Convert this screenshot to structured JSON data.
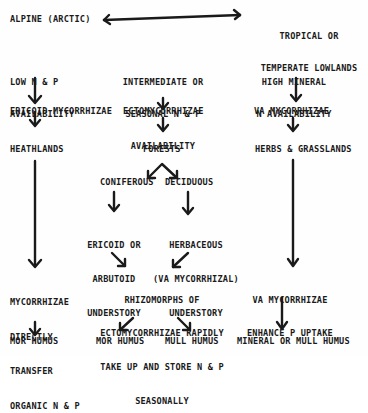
{
  "diagram": {
    "colors": {
      "ink": "#1a1a1a",
      "background": "#fefefe"
    },
    "top": {
      "left_label": "ALPINE (ARCTIC)",
      "right_label_line1": "TROPICAL OR",
      "right_label_line2": "TEMPERATE LOWLANDS",
      "connector": "double-headed-arrow"
    },
    "left_column": {
      "availability_line1": "LOW N & P",
      "availability_line2": "AVAILABILITY",
      "mycorrhizae": "ERICOID MYCORRHIZAE",
      "vegetation": "HEATHLANDS",
      "process_line1": "MYCORRHIZAE",
      "process_line2": "DIRECTLY",
      "process_line3": "TRANSFER",
      "process_line4": "ORGANIC N & P",
      "humus": "MOR HUMUS"
    },
    "middle_column": {
      "availability_line1": "INTERMEDIATE OR",
      "availability_line2": "SEASONAL N & P",
      "availability_line3": "AVAILABILITY",
      "mycorrhizae": "ECTOMYCORRHIZAE",
      "vegetation": "FORESTS",
      "branch_left": "CONIFEROUS",
      "branch_right": "DECIDUOUS",
      "understory_left_line1": "ERICOID OR",
      "understory_left_line2": "ARBUTOID",
      "understory_left_line3": "UNDERSTORY",
      "understory_right_line1": "HERBACEOUS",
      "understory_right_line2": "(VA MYCORRHIZAL)",
      "understory_right_line3": "UNDERSTORY",
      "process_line1": "RHIZOMORPHS OF",
      "process_line2": "ECTOMYCORRHIZAE RAPIDLY",
      "process_line3": "TAKE UP AND STORE N & P",
      "process_line4": "SEASONALLY",
      "humus_left": "MOR HUMUS",
      "humus_right": "MULL HUMUS"
    },
    "right_column": {
      "availability_line1": "HIGH MINERAL",
      "availability_line2": "N AVAILABILITY",
      "mycorrhizae": "VA MYCORRHIZAE",
      "vegetation": "HERBS & GRASSLANDS",
      "process_line1": "VA MYCORRHIZAE",
      "process_line2": "ENHANCE P UPTAKE",
      "humus": "MINERAL OR MULL HUMUS"
    }
  }
}
